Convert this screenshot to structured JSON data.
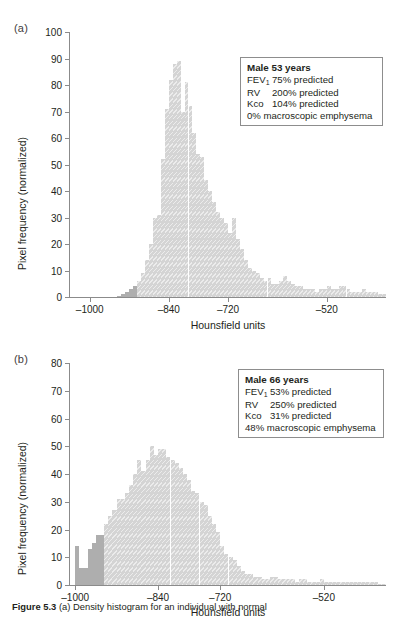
{
  "figure": {
    "caption_label": "Figure 5.3",
    "caption_text": " (a) Density histogram for an individual with normal"
  },
  "panels": [
    {
      "letter": "(a)",
      "ylabel": "Pixel frequency (normalized)",
      "xlabel": "Hounsfield units",
      "yticks": [
        0,
        10,
        20,
        30,
        40,
        50,
        60,
        70,
        80,
        90,
        100
      ],
      "xticks": [
        -1000,
        -840,
        -720,
        -520
      ],
      "xtick_labels": [
        "–1000",
        "–840",
        "–720",
        "–520"
      ],
      "infobox": {
        "title": "Male 53 years",
        "rows": [
          {
            "key": "FEV",
            "key_sub": "1",
            "value": "75% predicted"
          },
          {
            "key": "RV",
            "key_sub": "",
            "value": "200% predicted"
          },
          {
            "key": "Kco",
            "key_sub": "",
            "value": "104% predicted"
          }
        ],
        "last_line": "0% macroscopic emphysema"
      }
    },
    {
      "letter": "(b)",
      "ylabel": "Pixel frequency (normalized)",
      "xlabel": "Hounsfield units",
      "yticks": [
        0,
        10,
        20,
        30,
        40,
        50,
        60,
        70,
        80
      ],
      "xticks": [
        -1000,
        -840,
        -720,
        -520
      ],
      "xtick_labels": [
        "–1000",
        "–840",
        "–720",
        "–520"
      ],
      "infobox": {
        "title": "Male 66 years",
        "rows": [
          {
            "key": "FEV",
            "key_sub": "1",
            "value": "53% predicted"
          },
          {
            "key": "RV",
            "key_sub": "",
            "value": "250% predicted"
          },
          {
            "key": "Kco",
            "key_sub": "",
            "value": "31% predicted"
          }
        ],
        "last_line": "48% macroscopic emphysema"
      }
    }
  ],
  "chart_data": [
    {
      "type": "bar",
      "title": "(a) Male 53 years — density histogram",
      "xlabel": "Hounsfield units",
      "ylabel": "Pixel frequency (normalized)",
      "xlim": [
        -1040,
        -400
      ],
      "ylim": [
        0,
        100
      ],
      "bin_width": 8,
      "grid": false,
      "legend": "none",
      "threshold_hu": -910,
      "series": [
        {
          "name": "below -910 HU (dark)",
          "color": "#aeaeae"
        },
        {
          "name": "above -910 HU (light)",
          "color": "#d4d4d4"
        }
      ],
      "x": [
        -1040,
        -1032,
        -1024,
        -1016,
        -1008,
        -1000,
        -992,
        -984,
        -976,
        -968,
        -960,
        -952,
        -944,
        -936,
        -928,
        -920,
        -912,
        -904,
        -896,
        -888,
        -880,
        -872,
        -864,
        -856,
        -848,
        -840,
        -832,
        -824,
        -816,
        -808,
        -800,
        -792,
        -784,
        -776,
        -768,
        -760,
        -752,
        -744,
        -736,
        -728,
        -720,
        -712,
        -704,
        -696,
        -688,
        -680,
        -672,
        -664,
        -656,
        -648,
        -640,
        -632,
        -624,
        -616,
        -608,
        -600,
        -592,
        -584,
        -576,
        -568,
        -560,
        -552,
        -544,
        -536,
        -528,
        -520,
        -512,
        -504,
        -496,
        -488,
        -480,
        -472,
        -464,
        -456,
        -448,
        -440,
        -432,
        -424,
        -416,
        -408
      ],
      "values": [
        0,
        0,
        0,
        0,
        0,
        0,
        0,
        0,
        0,
        0,
        0,
        0,
        0.5,
        1,
        2,
        3,
        4,
        6,
        9,
        14,
        20,
        30,
        31,
        52,
        71,
        82,
        88,
        89,
        70,
        81,
        72,
        62,
        54,
        53,
        44,
        40,
        36,
        32,
        30,
        28,
        24,
        30,
        22,
        18,
        14,
        11,
        10,
        9,
        7,
        6,
        7,
        5,
        5,
        6,
        8,
        6,
        5,
        4,
        4,
        3,
        3,
        3,
        2,
        3,
        3,
        4,
        3,
        3,
        4,
        4,
        3,
        2,
        2,
        2,
        3,
        2,
        2,
        2,
        1,
        1
      ]
    },
    {
      "type": "bar",
      "title": "(b) Male 66 years — density histogram",
      "xlabel": "Hounsfield units",
      "ylabel": "Pixel frequency (normalized)",
      "xlim": [
        -1010,
        -400
      ],
      "ylim": [
        0,
        80
      ],
      "bin_width": 8,
      "grid": false,
      "legend": "none",
      "threshold_hu": -950,
      "series": [
        {
          "name": "below -950 HU (dark)",
          "color": "#aeaeae"
        },
        {
          "name": "above -950 HU (light)",
          "color": "#d4d4d4"
        }
      ],
      "x": [
        -1008,
        -1000,
        -992,
        -984,
        -976,
        -968,
        -960,
        -952,
        -944,
        -936,
        -928,
        -920,
        -912,
        -904,
        -896,
        -888,
        -880,
        -872,
        -864,
        -856,
        -848,
        -840,
        -832,
        -824,
        -816,
        -808,
        -800,
        -792,
        -784,
        -776,
        -768,
        -760,
        -752,
        -744,
        -736,
        -728,
        -720,
        -712,
        -704,
        -696,
        -688,
        -680,
        -672,
        -664,
        -656,
        -648,
        -640,
        -632,
        -624,
        -616,
        -608,
        -600,
        -592,
        -584,
        -576,
        -568,
        -560,
        -552,
        -544,
        -536,
        -528,
        -520,
        -512,
        -504,
        -496,
        -488,
        -480,
        -472,
        -464,
        -456,
        -448,
        -440,
        -432,
        -424,
        -416,
        -408
      ],
      "values": [
        0,
        14,
        6,
        6,
        13,
        15,
        18,
        18,
        22,
        25,
        27,
        31,
        31,
        33,
        36,
        40,
        45,
        41,
        45,
        50,
        47,
        49,
        49,
        46,
        45,
        44,
        42,
        40,
        38,
        34,
        33,
        30,
        29,
        25,
        22,
        19,
        14,
        11,
        10,
        9,
        7,
        5,
        4,
        4,
        3,
        3,
        2,
        2,
        3,
        3,
        2,
        2,
        2,
        2,
        1,
        2,
        2,
        1,
        1,
        1,
        2,
        1,
        1,
        1,
        1,
        1,
        1,
        1,
        1,
        1,
        1,
        1,
        1,
        1,
        0.5,
        0.5
      ]
    }
  ]
}
